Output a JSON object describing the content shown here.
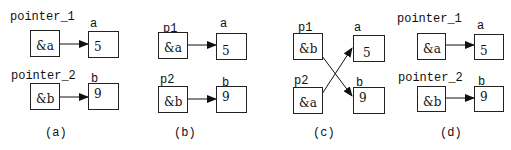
{
  "panels": [
    {
      "caption": "(a)",
      "row1": {
        "ptr_name": "pointer_1",
        "ptr_value": "&a",
        "var_name": "a",
        "var_value": "5"
      },
      "row2": {
        "ptr_name": "pointer_2",
        "ptr_value": "&b",
        "var_name": "b",
        "var_value": "9"
      }
    },
    {
      "caption": "(b)",
      "row1": {
        "ptr_name": "p1",
        "ptr_value": "&a",
        "var_name": "a",
        "var_value": "5"
      },
      "row2": {
        "ptr_name": "p2",
        "ptr_value": "&b",
        "var_name": "b",
        "var_value": "9"
      }
    },
    {
      "caption": "(c)",
      "row1": {
        "ptr_name": "p1",
        "ptr_value": "&b",
        "var_name": "a",
        "var_value": "5"
      },
      "row2": {
        "ptr_name": "p2",
        "ptr_value": "&a",
        "var_name": "b",
        "var_value": "9"
      }
    },
    {
      "caption": "(d)",
      "row1": {
        "ptr_name": "pointer_1",
        "ptr_value": "&a",
        "var_name": "a",
        "var_value": "5"
      },
      "row2": {
        "ptr_name": "pointer_2",
        "ptr_value": "&b",
        "var_name": "b",
        "var_value": "9"
      }
    }
  ]
}
